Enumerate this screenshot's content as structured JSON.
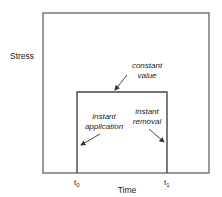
{
  "diagram": {
    "y_axis_label": "Stress",
    "x_axis_label": "Time",
    "x_ticks": [
      {
        "main": "t",
        "sub": "0"
      },
      {
        "main": "t",
        "sub": "1"
      }
    ],
    "annotations": {
      "constant": [
        "constant",
        "value"
      ],
      "application": [
        "instant",
        "application"
      ],
      "removal": [
        "instant",
        "removal"
      ]
    },
    "colors": {
      "line": "#444444",
      "text": "#222222"
    }
  }
}
